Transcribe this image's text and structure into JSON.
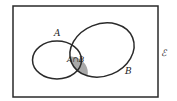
{
  "diagram": {
    "type": "venn",
    "universal_set_label": "ℰ",
    "set_a_label": "A",
    "set_b_label": "B",
    "intersection_label": "A∩B",
    "colors": {
      "outline": "#2a2a2a",
      "intersection_fill": "#a9a9a9",
      "background": "#ffffff"
    }
  }
}
